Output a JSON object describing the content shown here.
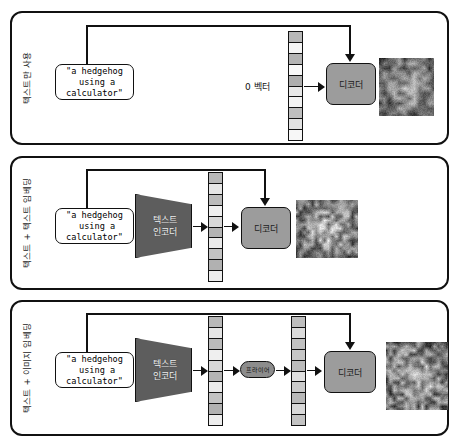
{
  "diagram": {
    "prompt_text": "\"a hedgehog\n using a\ncalculator\"",
    "colors": {
      "border": "#111111",
      "encoder_fill": "#5d5d5d",
      "decoder_fill": "#9c9c9c",
      "prior_fill": "#8c8c8c",
      "page_background": "#ffffff"
    },
    "panels": [
      {
        "id": "text-only",
        "side_label": "텍스트만 사용",
        "prompt": "\"a hedgehog\n using a\ncalculator\"",
        "zero_vector_label": "0 벡터",
        "decoder_label": "디코더",
        "has_text_encoder": false,
        "has_prior": false,
        "vector_count": 1,
        "output_caption": "blurry grayscale output image",
        "vectors": [
          [
            0.55,
            0.08,
            0.58,
            0.05,
            0.62,
            0.18,
            0.1,
            0.5,
            0.22,
            0.06
          ]
        ]
      },
      {
        "id": "text-plus-text-encoder",
        "side_label": "텍스트 + 텍스트 임베딩",
        "prompt": "\"a hedgehog\n using a\ncalculator\"",
        "encoder_label": "텍스트\n인코더",
        "decoder_label": "디코더",
        "has_text_encoder": true,
        "has_prior": false,
        "vector_count": 1,
        "output_caption": "person using a calculator, grayscale photo",
        "vectors": [
          [
            0.55,
            0.2,
            0.52,
            0.12,
            0.3,
            0.58,
            0.16,
            0.46,
            0.6,
            0.14
          ]
        ]
      },
      {
        "id": "text-plus-image-embedding",
        "side_label": "텍스트 + 이미지 임베딩",
        "prompt": "\"a hedgehog\n using a\ncalculator\"",
        "encoder_label": "텍스트\n인코더",
        "prior_label": "프라이어",
        "decoder_label": "디코더",
        "has_text_encoder": true,
        "has_prior": true,
        "vector_count": 2,
        "output_caption": "hedgehog on a calculator, grayscale photo",
        "vectors": [
          [
            0.55,
            0.2,
            0.52,
            0.12,
            0.3,
            0.58,
            0.16,
            0.46,
            0.6,
            0.14
          ],
          [
            0.5,
            0.28,
            0.48,
            0.44,
            0.52,
            0.24,
            0.4,
            0.54,
            0.3,
            0.46
          ]
        ]
      }
    ]
  }
}
